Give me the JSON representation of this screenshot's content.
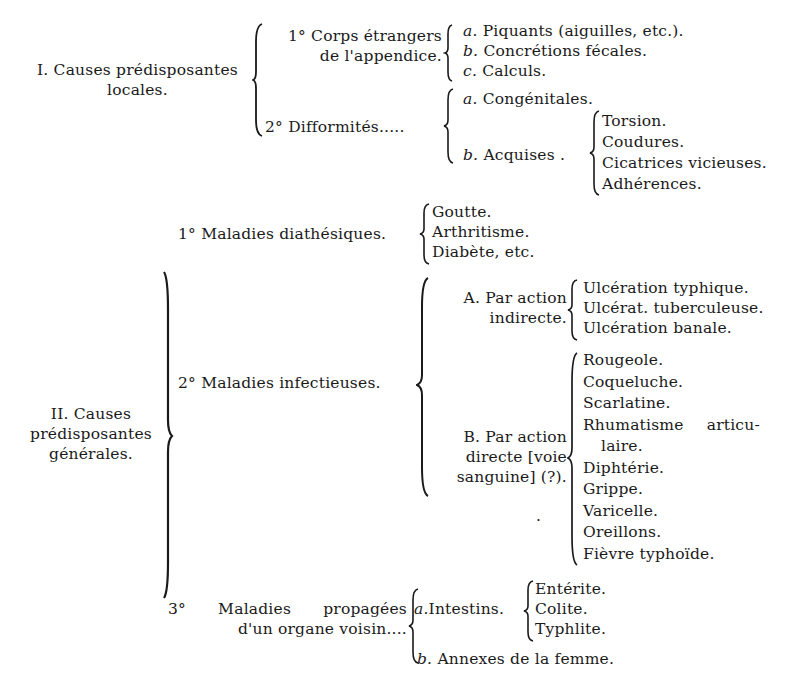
{
  "document": {
    "section_I": {
      "title_line1": "I. Causes prédisposantes",
      "title_line2": "locales.",
      "item1": {
        "label_line1": "1° Corps étrangers",
        "label_line2": "de l'appendice.",
        "subs": [
          {
            "letter": "a.",
            "text": "Piquants (aiguilles, etc.)."
          },
          {
            "letter": "b.",
            "text": "Concrétions fécales."
          },
          {
            "letter": "c.",
            "text": "Calculs."
          }
        ]
      },
      "item2": {
        "label": "2° Difformités.....",
        "sub_a": {
          "letter": "a.",
          "text": "Congénitales."
        },
        "sub_b": {
          "letter": "b.",
          "text": "Acquises .",
          "children": [
            "Torsion.",
            "Coudures.",
            "Cicatrices vicieuses.",
            "Adhérences."
          ]
        }
      }
    },
    "section_II": {
      "title_line1": "II. Causes",
      "title_line2": "prédisposantes",
      "title_line3": "générales.",
      "item1": {
        "label": "1° Maladies diathésiques.",
        "children": [
          "Goutte.",
          "Arthritisme.",
          "Diabète, etc."
        ]
      },
      "item2": {
        "label": "2° Maladies infectieuses.",
        "sub_A": {
          "label_line1": "A. Par action",
          "label_line2": "indirecte.",
          "children": [
            "Ulcération typhique.",
            "Ulcérat. tuberculeuse.",
            "Ulcération banale."
          ]
        },
        "sub_B": {
          "label_line1": "B. Par action",
          "label_line2": "directe [voie",
          "label_line3": "sanguine] (?).",
          "stray_mark": ".",
          "children": [
            "Rougeole.",
            "Coqueluche.",
            "Scarlatine.",
            "Rhumatisme articu-",
            "laire.",
            "Diphtérie.",
            "Grippe.",
            "Varicelle.",
            "Oreillons.",
            "Fièvre typhoïde."
          ]
        }
      },
      "item3": {
        "label_line1": "3° Maladies propagées",
        "label_line2": "d'un organe voisin....",
        "sub_a": {
          "letter": "a.",
          "text": "Intestins.",
          "children": [
            "Entérite.",
            "Colite.",
            "Typhlite."
          ]
        },
        "sub_b": {
          "letter": "b.",
          "text": "Annexes de la femme."
        }
      }
    }
  }
}
